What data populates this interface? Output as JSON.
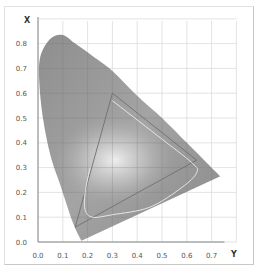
{
  "chart_data": {
    "type": "area",
    "title": "",
    "xlabel": "Y",
    "ylabel": "X",
    "xlim": [
      0.0,
      0.8
    ],
    "ylim": [
      0.0,
      0.9
    ],
    "grid": true,
    "legend": null,
    "x_ticks": [
      "0.0",
      "0.1",
      "0.2",
      "0.3",
      "0.4",
      "0.5",
      "0.6",
      "0.7"
    ],
    "y_ticks": [
      "0.0",
      "0.1",
      "0.2",
      "0.3",
      "0.4",
      "0.5",
      "0.6",
      "0.7",
      "0.8"
    ],
    "series": [
      {
        "name": "spectral-locus",
        "kind": "filled-region",
        "points": [
          [
            0.175,
            0.005
          ],
          [
            0.14,
            0.08
          ],
          [
            0.09,
            0.23
          ],
          [
            0.05,
            0.35
          ],
          [
            0.02,
            0.5
          ],
          [
            0.005,
            0.65
          ],
          [
            0.01,
            0.75
          ],
          [
            0.05,
            0.82
          ],
          [
            0.1,
            0.835
          ],
          [
            0.15,
            0.8
          ],
          [
            0.22,
            0.75
          ],
          [
            0.3,
            0.69
          ],
          [
            0.4,
            0.59
          ],
          [
            0.5,
            0.5
          ],
          [
            0.6,
            0.4
          ],
          [
            0.68,
            0.32
          ],
          [
            0.735,
            0.265
          ],
          [
            0.175,
            0.005
          ]
        ]
      },
      {
        "name": "gamut-triangle",
        "kind": "line",
        "points": [
          [
            0.64,
            0.33
          ],
          [
            0.3,
            0.6
          ],
          [
            0.15,
            0.06
          ],
          [
            0.64,
            0.33
          ]
        ]
      },
      {
        "name": "inner-gamut-curve",
        "kind": "line",
        "points": [
          [
            0.3,
            0.57
          ],
          [
            0.48,
            0.43
          ],
          [
            0.62,
            0.32
          ],
          [
            0.64,
            0.28
          ],
          [
            0.58,
            0.22
          ],
          [
            0.45,
            0.14
          ],
          [
            0.3,
            0.11
          ],
          [
            0.22,
            0.1
          ],
          [
            0.19,
            0.13
          ],
          [
            0.19,
            0.2
          ],
          [
            0.21,
            0.3
          ]
        ]
      }
    ],
    "annotations": []
  },
  "axes": {
    "x_name": "Y",
    "y_name": "X"
  }
}
